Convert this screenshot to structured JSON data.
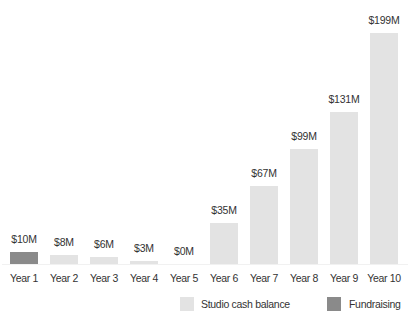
{
  "chart_data": {
    "type": "bar",
    "title": "",
    "xlabel": "",
    "ylabel": "",
    "categories": [
      "Year 1",
      "Year 2",
      "Year 3",
      "Year 4",
      "Year 5",
      "Year 6",
      "Year 7",
      "Year 8",
      "Year 9",
      "Year 10"
    ],
    "values": [
      10,
      8,
      6,
      3,
      0,
      35,
      67,
      99,
      131,
      199
    ],
    "value_labels": [
      "$10M",
      "$8M",
      "$6M",
      "$3M",
      "$0M",
      "$35M",
      "$67M",
      "$99M",
      "$131M",
      "$199M"
    ],
    "bar_series": [
      "Fundraising",
      "Studio cash balance",
      "Studio cash balance",
      "Studio cash balance",
      "Studio cash balance",
      "Studio cash balance",
      "Studio cash balance",
      "Studio cash balance",
      "Studio cash balance",
      "Studio cash balance"
    ],
    "series": [
      {
        "name": "Studio cash balance",
        "color": "#e3e3e3",
        "values": [
          null,
          8,
          6,
          3,
          0,
          35,
          67,
          99,
          131,
          199
        ]
      },
      {
        "name": "Fundraising",
        "color": "#8a8a8a",
        "values": [
          10,
          null,
          null,
          null,
          null,
          null,
          null,
          null,
          null,
          null
        ]
      }
    ],
    "unit": "$M",
    "ylim": [
      0,
      199
    ],
    "grid": false,
    "legend_position": "bottom-right"
  },
  "legend": [
    {
      "label": "Studio cash balance",
      "color": "#e3e3e3"
    },
    {
      "label": "Fundraising",
      "color": "#8a8a8a"
    }
  ]
}
